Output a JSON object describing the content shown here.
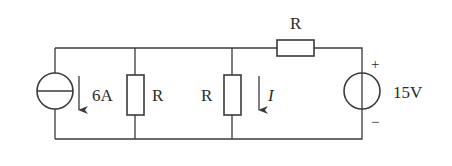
{
  "diagram": {
    "type": "circuit",
    "components": {
      "current_source": {
        "label": "6A",
        "direction": "down"
      },
      "resistor_1": {
        "label": "R"
      },
      "resistor_2": {
        "label": "R"
      },
      "resistor_top": {
        "label": "R"
      },
      "voltage_source": {
        "label": "15V",
        "plus": "+",
        "minus": "−"
      },
      "current_indicator": {
        "label": "I",
        "direction": "down"
      }
    }
  }
}
